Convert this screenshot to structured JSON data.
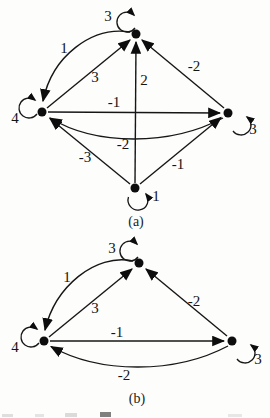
{
  "figure": {
    "graph_a": {
      "caption": "(a)",
      "loops": {
        "top": "3",
        "left": "4",
        "right": "3",
        "bottom": "1"
      },
      "edges": {
        "top_to_left": "1",
        "left_to_top": "3",
        "bottom_to_top": "2",
        "right_to_top": "-2",
        "left_to_right": "-1",
        "right_to_left": "-2",
        "bottom_to_left": "-3",
        "bottom_to_right": "-1"
      }
    },
    "graph_b": {
      "caption": "(b)",
      "loops": {
        "top": "3",
        "left": "4",
        "right": "3"
      },
      "edges": {
        "top_to_left": "1",
        "left_to_top": "3",
        "right_to_top": "-2",
        "left_to_right": "-1",
        "right_to_left": "-2"
      }
    },
    "colors": {
      "ink": "#161616",
      "paper": "#fdfdfc"
    }
  }
}
